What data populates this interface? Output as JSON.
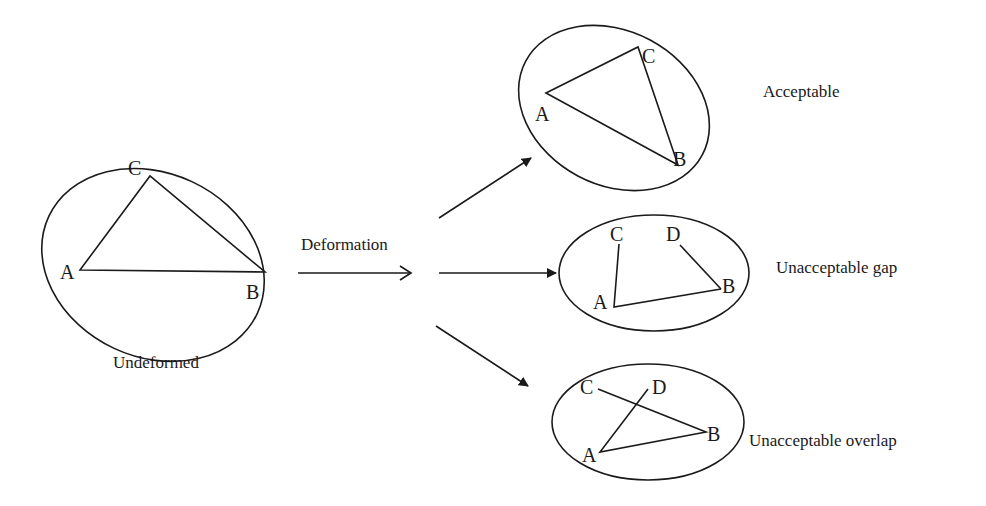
{
  "diagram": {
    "undeformed": {
      "caption": "Undeformed",
      "vertices": {
        "A": "A",
        "B": "B",
        "C": "C"
      }
    },
    "process": {
      "label": "Deformation"
    },
    "outcomes": [
      {
        "caption": "Acceptable",
        "vertices": {
          "A": "A",
          "B": "B",
          "C": "C"
        }
      },
      {
        "caption": "Unacceptable gap",
        "vertices": {
          "A": "A",
          "B": "B",
          "C": "C",
          "D": "D"
        }
      },
      {
        "caption": "Unacceptable overlap",
        "vertices": {
          "A": "A",
          "B": "B",
          "C": "C",
          "D": "D"
        }
      }
    ],
    "colors": {
      "stroke": "#1a1a1a",
      "background": "#ffffff"
    }
  }
}
